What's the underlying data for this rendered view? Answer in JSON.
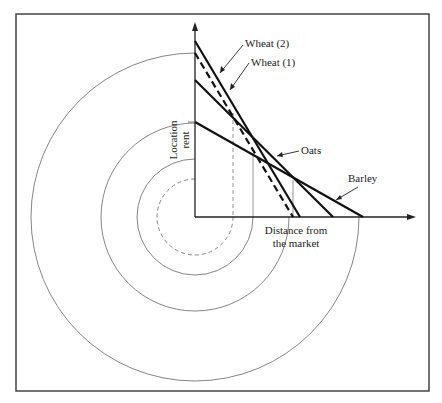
{
  "figure": {
    "y_axis_label_line1": "Location",
    "y_axis_label_line2": "rent",
    "x_axis_label_line1": "Distance from",
    "x_axis_label_line2": "the market",
    "curves": [
      {
        "name": "Wheat (2)",
        "style": "solid",
        "intercept_y": 41,
        "end_x": 300
      },
      {
        "name": "Wheat (1)",
        "style": "dashed",
        "intercept_y": 53,
        "end_x": 293
      },
      {
        "name": "Oats",
        "style": "solid",
        "intercept_y": 80,
        "end_x": 333
      },
      {
        "name": "Barley",
        "style": "solid",
        "intercept_y": 122,
        "end_x": 363
      }
    ],
    "labels": {
      "wheat2": "Wheat (2)",
      "wheat1": "Wheat (1)",
      "oats": "Oats",
      "barley": "Barley"
    },
    "rings": [
      {
        "radius": 38,
        "style": "dashed"
      },
      {
        "radius": 58,
        "style": "solid"
      },
      {
        "radius": 94,
        "style": "solid"
      },
      {
        "radius": 164,
        "style": "solid"
      }
    ]
  }
}
